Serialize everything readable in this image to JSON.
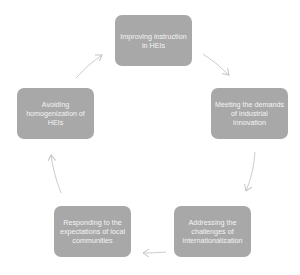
{
  "diagram": {
    "type": "cycle",
    "colors": {
      "node_fill": "#a8a8a8",
      "node_text": "#f4f4f4",
      "arrow": "#c8c8c8"
    },
    "nodes": [
      {
        "id": "top",
        "label": "Improving instruction in HEIs"
      },
      {
        "id": "right",
        "label": "Meeting the demands of industrial innovation"
      },
      {
        "id": "bottom-right",
        "label": "Addressing the challenges of internationalization"
      },
      {
        "id": "bottom-left",
        "label": "Responding to the expectations of local communities"
      },
      {
        "id": "left",
        "label": "Avoiding homogenization of HEIs"
      }
    ],
    "edges": [
      {
        "from": "top",
        "to": "right"
      },
      {
        "from": "right",
        "to": "bottom-right"
      },
      {
        "from": "bottom-right",
        "to": "bottom-left"
      },
      {
        "from": "bottom-left",
        "to": "left"
      },
      {
        "from": "left",
        "to": "top"
      }
    ]
  }
}
